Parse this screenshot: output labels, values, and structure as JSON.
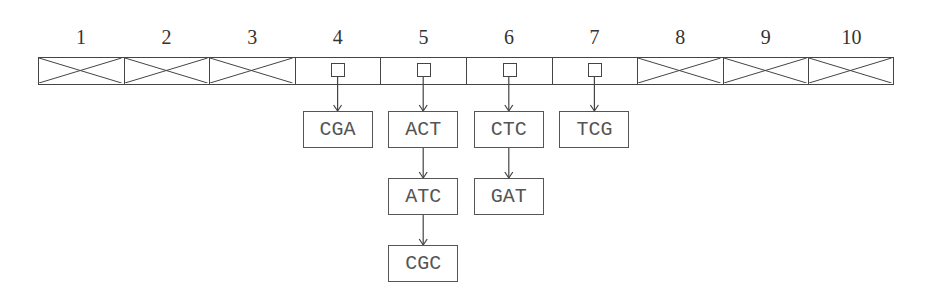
{
  "diagram": {
    "type": "hash-table-chaining",
    "cells": [
      {
        "index": "1",
        "state": "empty"
      },
      {
        "index": "2",
        "state": "empty"
      },
      {
        "index": "3",
        "state": "empty"
      },
      {
        "index": "4",
        "state": "pointer",
        "chain": [
          "CGA"
        ]
      },
      {
        "index": "5",
        "state": "pointer",
        "chain": [
          "ACT",
          "ATC",
          "CGC"
        ]
      },
      {
        "index": "6",
        "state": "pointer",
        "chain": [
          "CTC",
          "GAT"
        ]
      },
      {
        "index": "7",
        "state": "pointer",
        "chain": [
          "TCG"
        ]
      },
      {
        "index": "8",
        "state": "empty"
      },
      {
        "index": "9",
        "state": "empty"
      },
      {
        "index": "10",
        "state": "empty"
      }
    ],
    "colors": {
      "line": "#444444",
      "text": "#555555",
      "background": "#ffffff"
    }
  }
}
